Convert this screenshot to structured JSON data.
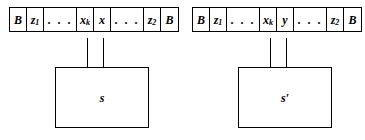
{
  "figure": {
    "caption": "",
    "background_color": "#ffffff",
    "line_color": "#000000"
  },
  "machines": [
    {
      "id": "machine-before",
      "state_label": "s",
      "tape": {
        "cells": [
          {
            "kind": "symbol",
            "base": "B",
            "sub": "",
            "width": "narrow"
          },
          {
            "kind": "symbol",
            "base": "z",
            "sub": "1",
            "width": "narrow"
          },
          {
            "kind": "ellipsis",
            "base": ". . .",
            "sub": "",
            "width": "wide"
          },
          {
            "kind": "symbol",
            "base": "x",
            "sub": "k",
            "width": "narrow"
          },
          {
            "kind": "symbol",
            "base": "x",
            "sub": "",
            "width": "narrow"
          },
          {
            "kind": "ellipsis",
            "base": ". . .",
            "sub": "",
            "width": "wide"
          },
          {
            "kind": "symbol",
            "base": "z",
            "sub": "2",
            "width": "narrow"
          },
          {
            "kind": "symbol",
            "base": "B",
            "sub": "",
            "width": "narrow"
          }
        ]
      }
    },
    {
      "id": "machine-after",
      "state_label": "s′",
      "tape": {
        "cells": [
          {
            "kind": "symbol",
            "base": "B",
            "sub": "",
            "width": "narrow"
          },
          {
            "kind": "symbol",
            "base": "z",
            "sub": "1",
            "width": "narrow"
          },
          {
            "kind": "ellipsis",
            "base": ". . .",
            "sub": "",
            "width": "wide"
          },
          {
            "kind": "symbol",
            "base": "x",
            "sub": "k",
            "width": "narrow"
          },
          {
            "kind": "symbol",
            "base": "y",
            "sub": "",
            "width": "narrow"
          },
          {
            "kind": "ellipsis",
            "base": ". . .",
            "sub": "",
            "width": "wide"
          },
          {
            "kind": "symbol",
            "base": "z",
            "sub": "2",
            "width": "narrow"
          },
          {
            "kind": "symbol",
            "base": "B",
            "sub": "",
            "width": "narrow"
          }
        ]
      }
    }
  ]
}
